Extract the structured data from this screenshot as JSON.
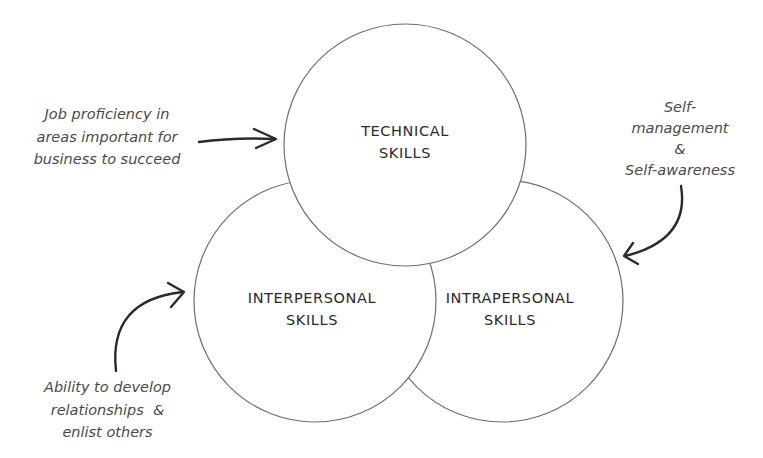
{
  "diagram": {
    "type": "venn",
    "circles": [
      {
        "id": "technical",
        "line1": "TECHNICAL",
        "line2": "SKILLS",
        "cx": 405,
        "cy": 145,
        "r": 121
      },
      {
        "id": "interpersonal",
        "line1": "INTERPERSONAL",
        "line2": "SKILLS",
        "cx": 315,
        "cy": 301,
        "r": 121
      },
      {
        "id": "intrapersonal",
        "line1": "INTRAPERSONAL",
        "line2": "SKILLS",
        "cx": 502,
        "cy": 301,
        "r": 121
      }
    ],
    "annotations": {
      "technical": {
        "lines": [
          "Job proficiency in",
          "areas important for",
          "business to succeed"
        ],
        "points_to": "technical"
      },
      "intrapersonal": {
        "lines": [
          "Self-",
          "management",
          "&",
          "Self-awareness"
        ],
        "points_to": "intrapersonal"
      },
      "interpersonal": {
        "lines": [
          "Ability to develop",
          "relationships  &",
          "enlist others"
        ],
        "points_to": "interpersonal"
      }
    },
    "colors": {
      "background": "#ffffff",
      "circle_stroke": "#6e6e6e",
      "label_text": "#2b2b2b",
      "note_text": "#4a4a4a",
      "arrow": "#2a2a2a"
    }
  }
}
